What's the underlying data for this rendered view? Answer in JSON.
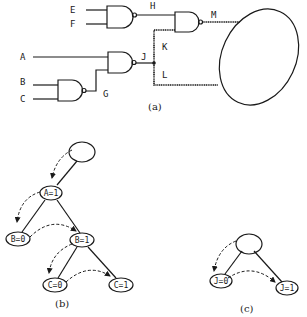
{
  "figure_a": {
    "caption": "(a)",
    "signals": {
      "E": "E",
      "F": "F",
      "H": "H",
      "M": "M",
      "K": "K",
      "A": "A",
      "J": "J",
      "L": "L",
      "B": "B",
      "C": "C",
      "G": "G"
    },
    "gates": [
      {
        "id": "nand-ef",
        "type": "NAND",
        "inputs": [
          "E",
          "F"
        ],
        "output": "H"
      },
      {
        "id": "nand-hk",
        "type": "NAND",
        "inputs": [
          "H",
          "K"
        ],
        "output": "M"
      },
      {
        "id": "nand-ag",
        "type": "NAND",
        "inputs": [
          "A",
          "G"
        ],
        "output": "J"
      },
      {
        "id": "nand-bc",
        "type": "NAND",
        "inputs": [
          "B",
          "C"
        ],
        "output": "G"
      }
    ],
    "highlighted_paths": [
      "M",
      "K",
      "L"
    ]
  },
  "figure_b": {
    "caption": "(b)",
    "nodes": {
      "root": "",
      "a1": "A=1",
      "b0": "B=0",
      "b1": "B=1",
      "c0": "C=0",
      "c1": "C=1"
    }
  },
  "figure_c": {
    "caption": "(c)",
    "nodes": {
      "root": "",
      "j0": "J=0",
      "j1": "J=1"
    }
  }
}
